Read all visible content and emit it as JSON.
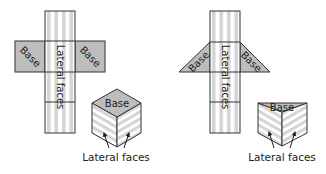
{
  "diagram": {
    "left": {
      "name": "cube-net",
      "net": {
        "lateral_label": "Lateral faces",
        "base_left_label": "Base",
        "base_right_label": "Base"
      },
      "solid": {
        "base_label": "Base",
        "lateral_label": "Lateral faces"
      }
    },
    "right": {
      "name": "triangular-prism-net",
      "net": {
        "lateral_label": "Lateral faces",
        "base_left_label": "Base",
        "base_right_label": "Base"
      },
      "solid": {
        "base_label": "Base",
        "lateral_label": "Lateral faces"
      }
    },
    "colors": {
      "base_fill": "#bdbdbd",
      "stripe_light": "#ffffff",
      "stripe_gray": "#d4d4d4",
      "outline": "#333333",
      "text": "#222222"
    }
  }
}
